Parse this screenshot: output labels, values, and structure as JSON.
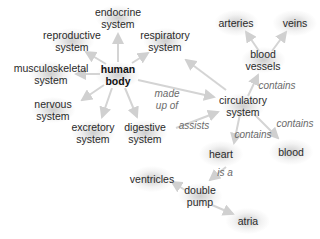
{
  "diagram": {
    "type": "concept-map",
    "colors": {
      "edge": "#d4d4d4",
      "node_text": "#2a2a2a",
      "label_text": "#6b6b6b",
      "node_glow": "#bebebe"
    },
    "nodes": {
      "human_body": "human\nbody",
      "endocrine": "endocrine\nsystem",
      "reproductive": "reproductive\nsystem",
      "respiratory": "respiratory\nsystem",
      "musculoskeletal": "musculoskeletal\nsystem",
      "nervous": "nervous\nsystem",
      "excretory": "excretory\nsystem",
      "digestive": "digestive\nsystem",
      "circulatory": "circulatory\nsystem",
      "blood_vessels": "blood\nvessels",
      "arteries": "arteries",
      "veins": "veins",
      "heart": "heart",
      "blood": "blood",
      "double_pump": "double\npump",
      "ventricles": "ventricles",
      "atria": "atria"
    },
    "edge_labels": {
      "made_up_of": "made\nup of",
      "assists": "assists",
      "contains_vessels": "contains",
      "contains_blood": "contains",
      "contains_heart": "contains",
      "is_a": "is a"
    }
  }
}
